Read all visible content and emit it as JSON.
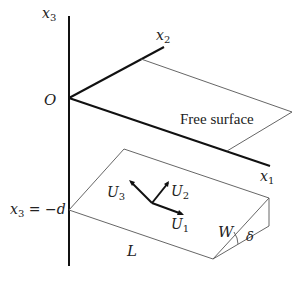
{
  "diagram": {
    "type": "3D coordinate geometry of a fault below a free surface",
    "colors": {
      "axis": "#111111",
      "plane": "#555555",
      "background": "#ffffff"
    },
    "axes": {
      "x1": {
        "label": "x",
        "subscript": "1"
      },
      "x2": {
        "label": "x",
        "subscript": "2"
      },
      "x3": {
        "label": "x",
        "subscript": "3"
      },
      "origin": "O"
    },
    "surfaces": {
      "free_surface": "Free surface"
    },
    "fault": {
      "depth_label_main": "x",
      "depth_label_sub": "3",
      "depth_label_rest": " = −d",
      "length": "L",
      "width": "W",
      "dip": "δ"
    },
    "slip_vectors": [
      {
        "name": "U",
        "sub": "1"
      },
      {
        "name": "U",
        "sub": "2"
      },
      {
        "name": "U",
        "sub": "3"
      }
    ]
  }
}
